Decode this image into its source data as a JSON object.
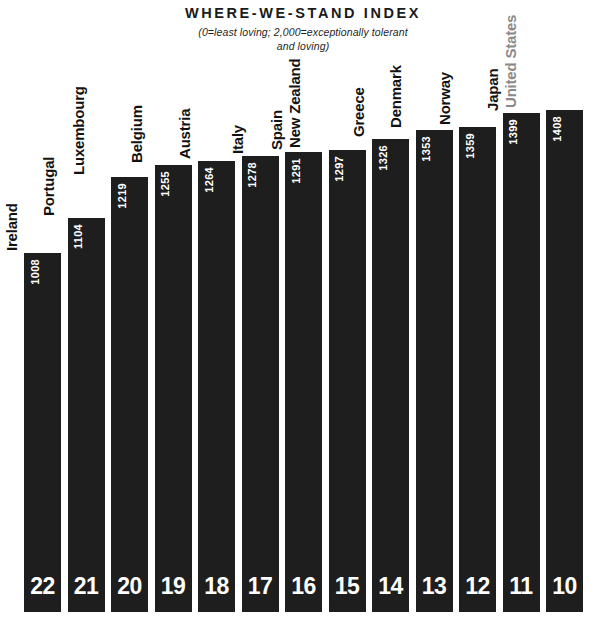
{
  "chart_data": {
    "type": "bar",
    "title": "WHERE-WE-STAND INDEX",
    "subtitle_line1": "(0=least loving; 2,000=exceptionally tolerant",
    "subtitle_line2": "and loving)",
    "xlabel": "",
    "ylabel": "",
    "ylim": [
      0,
      2000
    ],
    "grid": false,
    "legend": "none",
    "orientation": "vertical",
    "value_label_position": "inside-top",
    "category_label_position": "above-bar-rotated",
    "categories": [
      "Ireland",
      "Portugal",
      "Luxembourg",
      "Belgium",
      "Austria",
      "Italy",
      "Spain",
      "New Zealand",
      "Greece",
      "Denmark",
      "Norway",
      "Japan",
      "United States"
    ],
    "values": [
      1008,
      1104,
      1219,
      1255,
      1264,
      1278,
      1291,
      1297,
      1326,
      1353,
      1359,
      1399,
      1408
    ],
    "ranks": [
      22,
      21,
      20,
      19,
      18,
      17,
      16,
      15,
      14,
      13,
      12,
      11,
      10
    ],
    "highlighted_category": "United States",
    "colors": {
      "bar_fill": "#1e1e1e",
      "background": "#ffffff",
      "value_text": "#ffffff",
      "rank_text": "#ffffff",
      "category_text": "#121212",
      "highlight_category_text": "#8a8a8a",
      "title_text": "#1a1a1a"
    }
  }
}
